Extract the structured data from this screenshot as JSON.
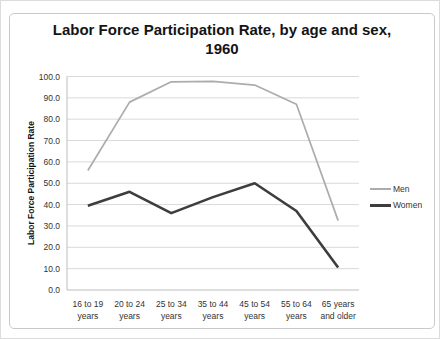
{
  "chart": {
    "title_lines": [
      "Labor Force Participation Rate, by age and sex,",
      "1960"
    ]
  },
  "chart_data": {
    "type": "line",
    "title": "Labor Force Participation Rate, by age and sex, 1960",
    "xlabel": "",
    "ylabel": "Labor Force Participation Rate",
    "categories": [
      "16 to 19 years",
      "20 to 24 years",
      "25 to 34 years",
      "35 to 44 years",
      "45 to 54 years",
      "55 to 64 years",
      "65 years and older"
    ],
    "series": [
      {
        "name": "Men",
        "color": "#acacac",
        "values": [
          56.0,
          88.0,
          97.5,
          97.7,
          96.0,
          87.0,
          32.5
        ]
      },
      {
        "name": "Women",
        "color": "#3d3d3d",
        "values": [
          39.5,
          46.0,
          36.0,
          43.5,
          50.0,
          37.0,
          10.5
        ]
      }
    ],
    "ylim": [
      0,
      100
    ],
    "ytick_step": 10,
    "ytick_decimals": 1,
    "grid": true,
    "legend_position": "right"
  }
}
